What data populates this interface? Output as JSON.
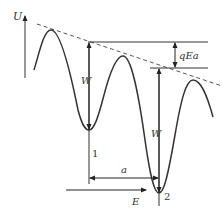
{
  "diagram": {
    "type": "potential-energy-curve",
    "axis": {
      "label": "U"
    },
    "annotations": {
      "barrier_height_label": "W",
      "barrier_height_label_2": "W",
      "field_drop_label": "qEa",
      "distance_label": "a",
      "field_label": "E",
      "site_1_label": "1",
      "site_2_label": "2"
    },
    "colors": {
      "curve": "#333333",
      "dashed_line": "#555555",
      "background": "#ffffff"
    }
  }
}
